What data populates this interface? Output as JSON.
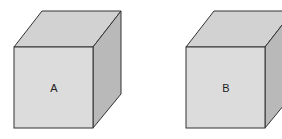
{
  "diagram": {
    "type": "two cubes side by side",
    "cubes": [
      {
        "label": "A",
        "front": [
          14,
          47,
          93,
          128
        ],
        "depth": [
          28,
          -36
        ]
      },
      {
        "label": "B",
        "front": [
          186,
          47,
          265,
          128
        ],
        "depth": [
          28,
          -36
        ]
      }
    ],
    "colors": {
      "front": "#dcdcdc",
      "top": "#d2d2d2",
      "side": "#b9b9b9",
      "edge": "#333333"
    }
  }
}
